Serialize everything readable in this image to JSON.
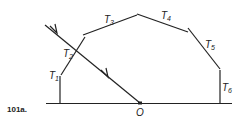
{
  "figure": {
    "label": "101a.",
    "origin_label": "O",
    "segments": [
      {
        "name": "T",
        "sub": "1"
      },
      {
        "name": "T",
        "sub": "2"
      },
      {
        "name": "T",
        "sub": "3"
      },
      {
        "name": "T",
        "sub": "4"
      },
      {
        "name": "T",
        "sub": "5"
      },
      {
        "name": "T",
        "sub": "6"
      }
    ],
    "colors": {
      "line": "#222222",
      "background": "#ffffff"
    }
  }
}
